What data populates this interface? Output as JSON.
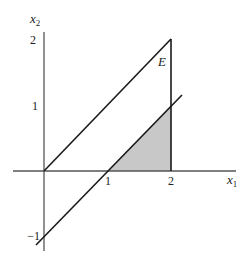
{
  "figure": {
    "axes": {
      "x_label": "x",
      "x_label_sub": "1",
      "y_label": "x",
      "y_label_sub": "2",
      "x_ticks": [
        "1",
        "2"
      ],
      "y_ticks": [
        "2",
        "1",
        "−1"
      ]
    },
    "region_label": "E",
    "colors": {
      "axis": "#555555",
      "line": "#1a1a1a",
      "shade": "#c8c8c8",
      "background": "#ffffff"
    },
    "elements": {
      "upper_line": "x2 = x1, from (0,0) to (2,2)",
      "lower_line": "x2 = x1 - 1, from about (-0.1,-1.1) to (2.2,1.2)",
      "vertical_segment": "x1 = 2, from (2,0) to (2,2)",
      "shaded_triangle": "vertices (1,0), (2,0), (2,1)"
    }
  }
}
